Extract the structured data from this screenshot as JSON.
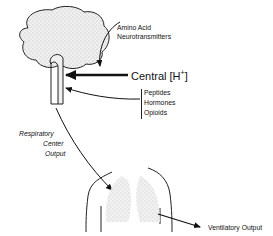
{
  "labels": {
    "amino_acid_line1": "Amino Acid",
    "amino_acid_line2": "Neurotransmitters",
    "central": "Central [H",
    "central_sup": "+",
    "central_close": "]",
    "peptides": "Peptides",
    "hormones": "Hormones",
    "opioids": "Opioids",
    "respiratory_line1": "Respiratory",
    "respiratory_line2": "Center",
    "respiratory_line3": "Output",
    "ventilatory": "Ventilatory Output"
  },
  "colors": {
    "ink": "#111111",
    "brain_fill": "#e6e6e6",
    "lung_fill": "#d9d9d9",
    "background": "#ffffff"
  }
}
